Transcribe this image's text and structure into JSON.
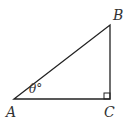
{
  "diagram": {
    "type": "right-triangle",
    "vertices": {
      "A": {
        "label": "A",
        "x": 14,
        "y": 99
      },
      "B": {
        "label": "B",
        "x": 110,
        "y": 25
      },
      "C": {
        "label": "C",
        "x": 110,
        "y": 99
      }
    },
    "angle_label": "θ°",
    "right_angle_at": "C",
    "stroke_color": "#222222"
  }
}
